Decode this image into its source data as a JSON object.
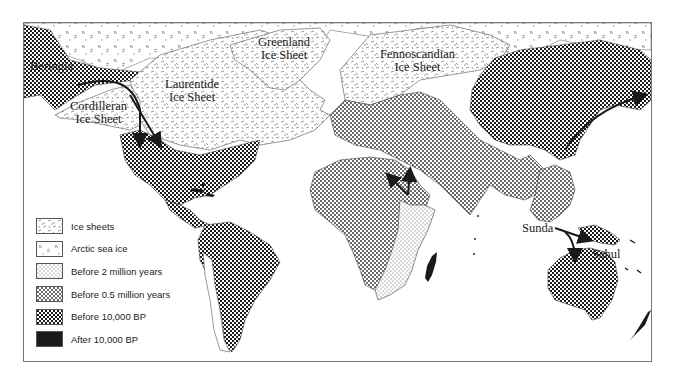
{
  "map": {
    "title": "",
    "region_labels": [
      {
        "id": "beringia",
        "text": "Beringia"
      },
      {
        "id": "cordilleran",
        "lines": [
          "Cordilleran",
          "Ice Sheet"
        ]
      },
      {
        "id": "laurentide",
        "lines": [
          "Laurentide",
          "Ice Sheet"
        ]
      },
      {
        "id": "greenland",
        "lines": [
          "Greenland",
          "Ice Sheet"
        ]
      },
      {
        "id": "fennoscandian",
        "lines": [
          "Fennoscandian",
          "Ice Sheet"
        ]
      },
      {
        "id": "sunda",
        "text": "Sunda"
      },
      {
        "id": "sahul",
        "text": "Sahul"
      }
    ],
    "labels": {
      "beringia": "Beringia",
      "cordilleran_1": "Cordilleran",
      "cordilleran_2": "Ice Sheet",
      "laurentide_1": "Laurentide",
      "laurentide_2": "Ice Sheet",
      "greenland_1": "Greenland",
      "greenland_2": "Ice Sheet",
      "fennoscandian_1": "Fennoscandian",
      "fennoscandian_2": "Ice Sheet",
      "sunda": "Sunda",
      "sahul": "Sahul"
    },
    "migration_arrows": [
      {
        "from": "Beringia",
        "to": "North America (west)"
      },
      {
        "from": "Beringia",
        "to": "North America (central)"
      },
      {
        "from": "East Africa",
        "to": "North Africa / Middle East"
      },
      {
        "from": "Siberia",
        "to": "Beringia"
      },
      {
        "from": "Sunda",
        "to": "Sahul (New Guinea)"
      },
      {
        "from": "Sunda",
        "to": "Australia"
      }
    ]
  },
  "legend": {
    "items": [
      {
        "key": "ice_sheets",
        "label": "Ice sheets",
        "pattern": "dashes"
      },
      {
        "key": "arctic_sea_ice",
        "label": "Arctic sea ice",
        "pattern": "sparse-dashes"
      },
      {
        "key": "before_2my",
        "label": "Before 2 million years",
        "pattern": "fine-dots"
      },
      {
        "key": "before_05my",
        "label": "Before 0.5 million years",
        "pattern": "dots"
      },
      {
        "key": "before_10000",
        "label": "Before 10,000 BP",
        "pattern": "checker"
      },
      {
        "key": "after_10000",
        "label": "After 10,000 BP",
        "pattern": "solid-black"
      }
    ]
  },
  "colors": {
    "ink": "#1a1a1a",
    "paper": "#ffffff",
    "frame": "#777777"
  }
}
